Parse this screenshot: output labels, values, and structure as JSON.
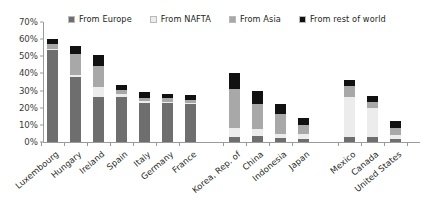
{
  "top_fragment": "",
  "legend": {
    "position": "top",
    "items": [
      {
        "label": "From Europe",
        "color": "#6e6e6e",
        "key": "europe"
      },
      {
        "label": "From NAFTA",
        "color": "#ececec",
        "key": "nafta"
      },
      {
        "label": "From Asia",
        "color": "#a8a8a8",
        "key": "asia"
      },
      {
        "label": "From rest of world",
        "color": "#111111",
        "key": "row"
      }
    ]
  },
  "yaxis": {
    "ticks": [
      "0%",
      "10%",
      "20%",
      "30%",
      "40%",
      "50%",
      "60%",
      "70%"
    ],
    "min": 0,
    "max": 70
  },
  "chart_data": {
    "type": "bar",
    "stacked": true,
    "title": "",
    "subtitle": "",
    "xlabel": "",
    "ylabel": "",
    "ylim": [
      0,
      70
    ],
    "ytick_values": [
      0,
      10,
      20,
      30,
      40,
      50,
      60,
      70
    ],
    "ytick_labels": [
      "0%",
      "10%",
      "20%",
      "30%",
      "40%",
      "50%",
      "60%",
      "70%"
    ],
    "grid": false,
    "legend_position": "top",
    "units": "percent",
    "groups": [
      {
        "name": "europe-group",
        "categories": [
          "Luxembourg",
          "Hungary",
          "Ireland",
          "Spain",
          "Italy",
          "Germany",
          "France"
        ]
      },
      {
        "name": "asia-group",
        "categories": [
          "Korea, Rep. of",
          "China",
          "Indonesia",
          "Japan"
        ]
      },
      {
        "name": "nafta-group",
        "categories": [
          "Mexico",
          "Canada",
          "United States"
        ]
      }
    ],
    "categories": [
      "Luxembourg",
      "Hungary",
      "Ireland",
      "Spain",
      "Italy",
      "Germany",
      "France",
      "Korea, Rep. of",
      "China",
      "Indonesia",
      "Japan",
      "Mexico",
      "Canada",
      "United States"
    ],
    "series": [
      {
        "name": "From Europe",
        "color": "#6e6e6e",
        "values": [
          53.5,
          38.0,
          26.0,
          26.5,
          23.0,
          22.5,
          22.0,
          3.0,
          3.5,
          2.5,
          1.5,
          3.0,
          3.0,
          1.5
        ]
      },
      {
        "name": "From NAFTA",
        "color": "#ececec",
        "values": [
          1.0,
          1.0,
          6.0,
          1.5,
          1.0,
          1.0,
          1.0,
          5.0,
          4.0,
          2.0,
          3.0,
          23.0,
          17.0,
          2.5
        ]
      },
      {
        "name": "From Asia",
        "color": "#a8a8a8",
        "values": [
          2.5,
          12.5,
          12.5,
          2.5,
          1.5,
          2.0,
          1.5,
          23.0,
          14.5,
          12.0,
          5.5,
          6.5,
          3.5,
          4.0
        ]
      },
      {
        "name": "From rest of world",
        "color": "#111111",
        "values": [
          3.0,
          4.5,
          6.0,
          3.0,
          3.5,
          2.5,
          3.0,
          9.0,
          8.0,
          5.5,
          4.0,
          3.5,
          3.5,
          4.0
        ]
      }
    ],
    "totals": [
      60.0,
      56.0,
      50.5,
      33.5,
      29.0,
      28.0,
      27.5,
      40.0,
      30.0,
      22.0,
      14.0,
      36.0,
      27.0,
      12.0
    ]
  },
  "bar_positions": [
    {
      "category": "Luxembourg",
      "x": 47
    },
    {
      "category": "Hungary",
      "x": 70
    },
    {
      "category": "Ireland",
      "x": 93
    },
    {
      "category": "Spain",
      "x": 116
    },
    {
      "category": "Italy",
      "x": 139
    },
    {
      "category": "Germany",
      "x": 162
    },
    {
      "category": "France",
      "x": 185
    },
    {
      "category": "Korea, Rep. of",
      "x": 229
    },
    {
      "category": "China",
      "x": 252
    },
    {
      "category": "Indonesia",
      "x": 275
    },
    {
      "category": "Japan",
      "x": 298
    },
    {
      "category": "Mexico",
      "x": 344
    },
    {
      "category": "Canada",
      "x": 367
    },
    {
      "category": "United States",
      "x": 390
    }
  ]
}
